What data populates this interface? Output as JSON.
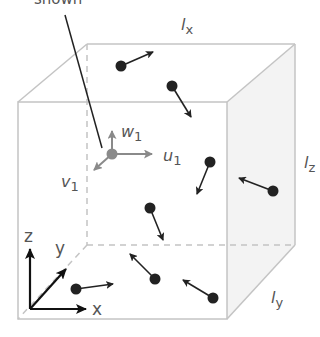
{
  "diagram": {
    "callout_text": "shown",
    "edge_labels": {
      "lx": {
        "main": "l",
        "sub": "x"
      },
      "ly": {
        "main": "l",
        "sub": "y"
      },
      "lz": {
        "main": "l",
        "sub": "z"
      }
    },
    "local_axes": {
      "u": {
        "main": "u",
        "sub": "1"
      },
      "v": {
        "main": "v",
        "sub": "1"
      },
      "w": {
        "main": "w",
        "sub": "1"
      }
    },
    "global_axes": {
      "x": "x",
      "y": "y",
      "z": "z"
    },
    "colors": {
      "cube_edge": "#c4c4c4",
      "side_face": "#f3f3f3",
      "particle": "#222222",
      "local_axis": "#8a8a8a",
      "label": "#555555"
    },
    "particle_count": 8
  }
}
